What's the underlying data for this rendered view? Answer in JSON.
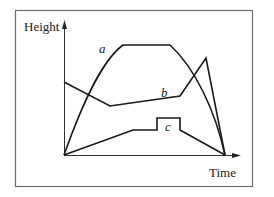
{
  "diagram": {
    "axes": {
      "y_label": "Height",
      "x_label": "Time"
    },
    "curves": [
      {
        "id": "a",
        "label": "a",
        "description": "rises steeply, plateaus at max height, then falls to zero"
      },
      {
        "id": "b",
        "label": "b",
        "description": "starts mid-height, dips, rises slowly, spikes, then falls to zero"
      },
      {
        "id": "c",
        "label": "c",
        "description": "rises slowly, small step plateau, then falls to zero"
      }
    ],
    "colors": {
      "line": "#1a1a1a",
      "frame": "#6e6e6e",
      "background": "#ffffff"
    }
  }
}
